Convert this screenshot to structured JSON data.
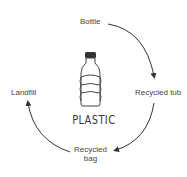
{
  "diagram": {
    "title": "PLASTIC",
    "center_icon": "plastic-bottle-icon",
    "stages": [
      {
        "label": "Bottle"
      },
      {
        "label": "Recycled tub"
      },
      {
        "label": "Recycled\nbag"
      },
      {
        "label": "Landfill"
      }
    ],
    "stage_lines": {
      "bag_line1": "Recycled",
      "bag_line2": "bag"
    },
    "colors": {
      "line": "#333333",
      "text": "#444444"
    }
  }
}
